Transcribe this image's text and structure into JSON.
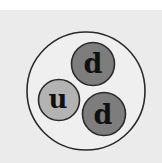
{
  "diagram": {
    "outer_particle": {
      "cx": 86,
      "cy": 91,
      "r": 59,
      "fill": "#efefef",
      "stroke": "#2a2a2a"
    },
    "quarks": [
      {
        "label": "d",
        "cx": 93,
        "cy": 64,
        "r": 21.5,
        "fill": "#7d7d7d",
        "stroke": "#2a2a2a"
      },
      {
        "label": "u",
        "cx": 59,
        "cy": 100,
        "r": 20.5,
        "fill": "#b3b3b3",
        "stroke": "#2a2a2a"
      },
      {
        "label": "d",
        "cx": 104,
        "cy": 114,
        "r": 21.5,
        "fill": "#7d7d7d",
        "stroke": "#2a2a2a"
      }
    ],
    "label_color": "#111111",
    "background": "#ebebeb"
  }
}
